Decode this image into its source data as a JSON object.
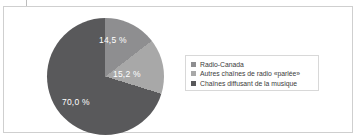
{
  "chart_data": {
    "type": "pie",
    "title": "",
    "subtitle": "",
    "xlabel": "",
    "ylabel": "",
    "legend_position": "right",
    "grid": false,
    "start_angle_deg": 0,
    "direction": "clockwise",
    "categories": [
      "Radio-Canada",
      "Autres chaînes de radio «parlée»",
      "Chaînes diffusant de la musique"
    ],
    "values": [
      14.5,
      15.2,
      70.0
    ],
    "value_labels": [
      "14,5 %",
      "15,2 %",
      "70,0 %"
    ],
    "colors": [
      "#8e8e90",
      "#a8a8a8",
      "#59595b"
    ],
    "units": "percent",
    "total": 99.7
  },
  "legend": {
    "items": [
      {
        "label": "Radio-Canada",
        "color": "#8e8e90"
      },
      {
        "label": "Autres chaînes de radio «parlée»",
        "color": "#a8a8a8"
      },
      {
        "label": "Chaînes diffusant de la musique",
        "color": "#59595b"
      }
    ]
  },
  "style": {
    "frame_border": "#cfcfcf",
    "legend_border": "#d8d8d8",
    "background": "#ffffff",
    "label_text_color": "#ffffff",
    "legend_text_color": "#3b3b3b"
  }
}
